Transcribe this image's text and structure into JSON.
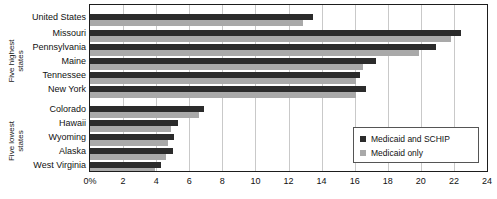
{
  "chart_data": {
    "type": "bar",
    "orientation": "horizontal",
    "title": "",
    "xlabel": "",
    "ylabel": "",
    "xlim": [
      0,
      24
    ],
    "xticks": [
      "0%",
      "2",
      "4",
      "6",
      "8",
      "10",
      "12",
      "14",
      "16",
      "18",
      "20",
      "22",
      "24"
    ],
    "xtick_values": [
      0,
      2,
      4,
      6,
      8,
      10,
      12,
      14,
      16,
      18,
      20,
      22,
      24
    ],
    "grid": "vertical",
    "legend_position": "lower-right",
    "series": [
      {
        "name": "Medicaid and SCHIP",
        "color": "#2b2b2b",
        "values": [
          13.5,
          22.4,
          20.9,
          17.3,
          16.3,
          16.7,
          6.9,
          5.3,
          5.1,
          5.0,
          4.3
        ]
      },
      {
        "name": "Medicaid only",
        "color": "#a9a9a9",
        "values": [
          12.9,
          21.8,
          19.9,
          16.5,
          16.1,
          16.1,
          6.6,
          4.9,
          4.7,
          4.6,
          3.9
        ]
      }
    ],
    "categories": [
      "United States",
      "Missouri",
      "Pennsylvania",
      "Maine",
      "Tennessee",
      "New York",
      "Colorado",
      "Hawaii",
      "Wyoming",
      "Alaska",
      "West Virginia"
    ],
    "groups": [
      {
        "label_line1": "Five highest",
        "label_line2": "states",
        "categories": [
          "Missouri",
          "Pennsylvania",
          "Maine",
          "Tennessee",
          "New York"
        ]
      },
      {
        "label_line1": "Five lowest",
        "label_line2": "states",
        "categories": [
          "Colorado",
          "Hawaii",
          "Wyoming",
          "Alaska",
          "West Virginia"
        ]
      }
    ]
  },
  "legend": {
    "items": [
      {
        "label": "Medicaid and SCHIP",
        "color": "#2b2b2b"
      },
      {
        "label": "Medicaid only",
        "color": "#a9a9a9"
      }
    ]
  },
  "group_labels": {
    "highest": {
      "line1": "Five highest",
      "line2": "states"
    },
    "lowest": {
      "line1": "Five lowest",
      "line2": "states"
    }
  },
  "categories": {
    "c0": "United States",
    "c1": "Missouri",
    "c2": "Pennsylvania",
    "c3": "Maine",
    "c4": "Tennessee",
    "c5": "New York",
    "c6": "Colorado",
    "c7": "Hawaii",
    "c8": "Wyoming",
    "c9": "Alaska",
    "c10": "West Virginia"
  },
  "xaxis": {
    "t0": "0%",
    "t1": "2",
    "t2": "4",
    "t3": "6",
    "t4": "8",
    "t5": "10",
    "t6": "12",
    "t7": "14",
    "t8": "16",
    "t9": "18",
    "t10": "20",
    "t11": "22",
    "t12": "24"
  }
}
